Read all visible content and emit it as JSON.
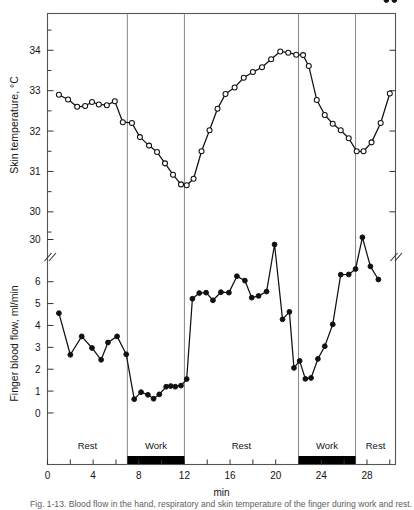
{
  "figure": {
    "caption": "Fig. 1-13.  Blood flow in the hand, respiratory and skin temperature of the finger during work and rest.",
    "xlabel": "min"
  },
  "chart_data": [
    {
      "type": "line",
      "title": "",
      "ylabel": "Skin temperature, °C",
      "xlabel": "min",
      "ylim": [
        29.6,
        34.7
      ],
      "xlim": [
        0,
        30.5
      ],
      "yticks": [
        30,
        31,
        32,
        33,
        34
      ],
      "minor_ytick_step": 0.5,
      "marker": "open-circle",
      "grid": false,
      "series": [
        {
          "name": "Skin temperature",
          "x": [
            1.0,
            1.8,
            2.6,
            3.3,
            3.9,
            4.5,
            5.2,
            5.9,
            6.6,
            7.4,
            8.1,
            8.9,
            9.6,
            10.3,
            11.0,
            11.7,
            12.2,
            12.8,
            13.5,
            14.2,
            14.9,
            15.6,
            16.4,
            17.2,
            18.0,
            18.8,
            19.6,
            20.4,
            21.1,
            21.8,
            22.4,
            22.9,
            23.6,
            24.3,
            25.0,
            25.7,
            26.4,
            27.1,
            27.7,
            28.4,
            29.2,
            30.0
          ],
          "y": [
            32.9,
            32.78,
            32.6,
            32.62,
            32.72,
            32.66,
            32.64,
            32.74,
            32.22,
            32.2,
            31.85,
            31.64,
            31.48,
            31.2,
            30.92,
            30.68,
            30.66,
            30.82,
            31.5,
            32.02,
            32.55,
            32.92,
            33.08,
            33.32,
            33.46,
            33.58,
            33.78,
            33.97,
            33.94,
            33.89,
            33.88,
            33.61,
            32.77,
            32.4,
            32.18,
            32.02,
            31.82,
            31.5,
            31.5,
            31.72,
            32.2,
            32.93
          ],
          "extra_x": [
            30.6,
            31.2
          ],
          "extra_y": [
            33.34,
            33.64
          ]
        }
      ]
    },
    {
      "type": "line",
      "title": "",
      "ylabel": "Finger blood flow, ml/min",
      "xlabel": "min",
      "ylim": [
        -0.55,
        6.9
      ],
      "ylim_upper_segment": [
        28.0,
        31.2
      ],
      "xlim": [
        0,
        30.5
      ],
      "yticks": [
        0,
        1,
        2,
        3,
        4,
        5,
        6
      ],
      "yticks_upper_segment": [
        30
      ],
      "axis_break": true,
      "axis_break_label": "//",
      "marker": "filled-circle",
      "grid": false,
      "series": [
        {
          "name": "Finger blood flow",
          "x": [
            1.0,
            2.0,
            3.0,
            3.9,
            4.7,
            5.3,
            6.1,
            6.9,
            7.6,
            8.2,
            8.8,
            9.3,
            9.8,
            10.4,
            10.8,
            11.2,
            11.7,
            12.2,
            12.7,
            13.3,
            13.9,
            14.5,
            15.2,
            15.9,
            16.6,
            17.3,
            17.9,
            18.5,
            19.2,
            19.9,
            20.6,
            21.2,
            21.6,
            22.1,
            22.6,
            23.1,
            23.7,
            24.3,
            25.0,
            25.7,
            26.4,
            27.0,
            27.6,
            28.3,
            29.0,
            29.7,
            30.4
          ],
          "y": [
            4.56,
            2.66,
            3.5,
            2.97,
            2.43,
            3.22,
            3.5,
            2.68,
            0.63,
            0.95,
            0.83,
            0.65,
            0.85,
            1.2,
            1.23,
            1.2,
            1.25,
            1.55,
            5.22,
            5.48,
            5.5,
            5.15,
            5.52,
            5.5,
            6.25,
            6.05,
            5.27,
            5.35,
            5.55,
            29.2,
            4.28,
            4.62,
            2.06,
            2.38,
            1.56,
            1.6,
            2.47,
            3.05,
            4.05,
            6.32,
            6.33,
            6.58,
            30.35,
            6.7,
            6.1
          ]
        }
      ]
    }
  ],
  "xaxis": {
    "label": "min",
    "ticks": [
      0,
      2,
      4,
      6,
      8,
      10,
      12,
      14,
      16,
      18,
      20,
      22,
      24,
      26,
      28,
      30
    ],
    "labeled_ticks": [
      0,
      4,
      8,
      12,
      16,
      20,
      24,
      28
    ]
  },
  "phases": [
    {
      "label": "Rest",
      "start": 0,
      "end": 7,
      "shaded": false
    },
    {
      "label": "Work",
      "start": 7,
      "end": 12,
      "shaded": true
    },
    {
      "label": "Rest",
      "start": 12,
      "end": 22,
      "shaded": false
    },
    {
      "label": "Work",
      "start": 22,
      "end": 27,
      "shaded": true
    },
    {
      "label": "Rest",
      "start": 27,
      "end": 30.5,
      "shaded": false
    }
  ],
  "colors": {
    "line": "#111111",
    "frame": "#555555",
    "divider": "#888888",
    "marker_fill_open": "#ffffff",
    "marker_fill_closed": "#111111",
    "bar": "#000000"
  }
}
